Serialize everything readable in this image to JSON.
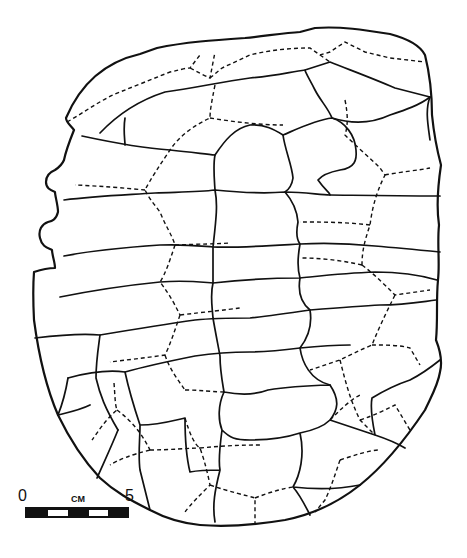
{
  "figure": {
    "line_legend": {
      "solid": "scute sulci",
      "dashed": "bone sutures"
    },
    "colors": {
      "ink": "#111111",
      "background": "#ffffff"
    }
  },
  "scale_bar": {
    "start_label": "0",
    "unit_label": "CM",
    "end_label": "5",
    "segments": 5,
    "pattern": [
      "black",
      "white",
      "black",
      "white",
      "black"
    ]
  }
}
